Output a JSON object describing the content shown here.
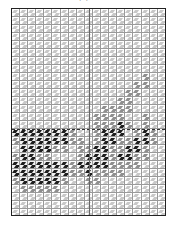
{
  "diagram": {
    "type": "weave-draft-grid",
    "top_caption": "(b) ...",
    "bottom_caption": "",
    "columns": 19,
    "rows": 26,
    "legend": {
      "0": "light cell",
      "1": "medium gray cell",
      "2": "dark cell"
    },
    "colors": {
      "frame": "#222222",
      "grid_line": "#9a9a9a",
      "light": "#c8c8c8",
      "mid": "#8f8f8f",
      "dark": "#1e1e1e"
    },
    "divider_row": 15,
    "center_column_line": 9.5,
    "cells": [
      [
        0,
        0,
        0,
        0,
        0,
        0,
        0,
        0,
        0,
        0,
        0,
        0,
        0,
        0,
        0,
        0,
        0,
        0,
        0
      ],
      [
        0,
        0,
        0,
        0,
        0,
        0,
        0,
        0,
        0,
        0,
        0,
        0,
        0,
        0,
        0,
        0,
        0,
        0,
        0
      ],
      [
        0,
        0,
        0,
        0,
        0,
        0,
        0,
        0,
        0,
        0,
        0,
        0,
        0,
        0,
        0,
        0,
        0,
        0,
        0
      ],
      [
        0,
        0,
        0,
        0,
        0,
        0,
        0,
        0,
        0,
        0,
        0,
        0,
        0,
        0,
        0,
        0,
        0,
        0,
        0
      ],
      [
        0,
        0,
        0,
        0,
        0,
        0,
        0,
        0,
        0,
        0,
        0,
        0,
        0,
        0,
        0,
        0,
        0,
        0,
        0
      ],
      [
        0,
        0,
        0,
        0,
        0,
        0,
        0,
        0,
        0,
        0,
        0,
        0,
        0,
        0,
        0,
        0,
        0,
        0,
        0
      ],
      [
        0,
        0,
        0,
        0,
        0,
        0,
        0,
        0,
        0,
        0,
        0,
        0,
        0,
        0,
        0,
        0,
        0,
        0,
        0
      ],
      [
        0,
        0,
        0,
        0,
        0,
        0,
        0,
        0,
        0,
        0,
        0,
        0,
        0,
        0,
        0,
        0,
        0,
        0,
        0
      ],
      [
        0,
        0,
        0,
        0,
        0,
        0,
        0,
        0,
        0,
        0,
        0,
        0,
        0,
        0,
        0,
        0,
        1,
        0,
        0
      ],
      [
        0,
        0,
        0,
        0,
        0,
        0,
        0,
        0,
        0,
        0,
        0,
        0,
        0,
        0,
        0,
        1,
        1,
        0,
        0
      ],
      [
        0,
        0,
        0,
        0,
        0,
        0,
        0,
        0,
        0,
        0,
        0,
        0,
        0,
        0,
        1,
        1,
        0,
        0,
        0
      ],
      [
        0,
        0,
        0,
        0,
        0,
        0,
        0,
        0,
        0,
        0,
        0,
        0,
        0,
        1,
        1,
        0,
        0,
        0,
        0
      ],
      [
        0,
        0,
        0,
        0,
        0,
        0,
        0,
        0,
        0,
        0,
        0,
        1,
        1,
        1,
        1,
        0,
        0,
        0,
        0
      ],
      [
        0,
        0,
        0,
        0,
        0,
        0,
        0,
        0,
        0,
        0,
        1,
        1,
        1,
        1,
        0,
        0,
        1,
        0,
        0
      ],
      [
        0,
        0,
        0,
        0,
        0,
        0,
        0,
        0,
        0,
        0,
        1,
        1,
        1,
        2,
        1,
        0,
        1,
        0,
        0
      ],
      [
        2,
        2,
        2,
        2,
        2,
        2,
        2,
        1,
        0,
        0,
        1,
        2,
        2,
        2,
        0,
        1,
        2,
        1,
        0
      ],
      [
        1,
        2,
        2,
        2,
        2,
        2,
        2,
        1,
        1,
        0,
        1,
        2,
        2,
        1,
        1,
        2,
        2,
        1,
        0
      ],
      [
        0,
        2,
        2,
        2,
        2,
        1,
        1,
        0,
        1,
        1,
        2,
        2,
        1,
        1,
        2,
        2,
        1,
        0,
        0
      ],
      [
        1,
        2,
        2,
        1,
        1,
        0,
        0,
        0,
        1,
        2,
        2,
        2,
        1,
        2,
        2,
        1,
        1,
        0,
        0
      ],
      [
        2,
        2,
        2,
        2,
        2,
        2,
        2,
        1,
        2,
        2,
        2,
        2,
        1,
        1,
        1,
        1,
        0,
        0,
        0
      ],
      [
        2,
        2,
        2,
        2,
        2,
        2,
        2,
        1,
        1,
        2,
        1,
        1,
        1,
        1,
        0,
        0,
        0,
        0,
        0
      ],
      [
        1,
        2,
        2,
        2,
        2,
        2,
        1,
        0,
        0,
        1,
        1,
        0,
        0,
        0,
        0,
        0,
        0,
        0,
        0
      ],
      [
        0,
        1,
        1,
        1,
        1,
        1,
        0,
        0,
        0,
        0,
        0,
        0,
        0,
        0,
        0,
        0,
        0,
        0,
        0
      ],
      [
        0,
        0,
        0,
        0,
        0,
        0,
        0,
        0,
        0,
        0,
        0,
        0,
        0,
        0,
        0,
        0,
        0,
        0,
        0
      ],
      [
        0,
        0,
        0,
        0,
        0,
        0,
        0,
        0,
        0,
        0,
        0,
        0,
        0,
        0,
        0,
        0,
        0,
        0,
        0
      ],
      [
        0,
        0,
        0,
        0,
        0,
        0,
        0,
        0,
        0,
        0,
        0,
        0,
        0,
        0,
        0,
        0,
        0,
        0,
        0
      ]
    ]
  }
}
